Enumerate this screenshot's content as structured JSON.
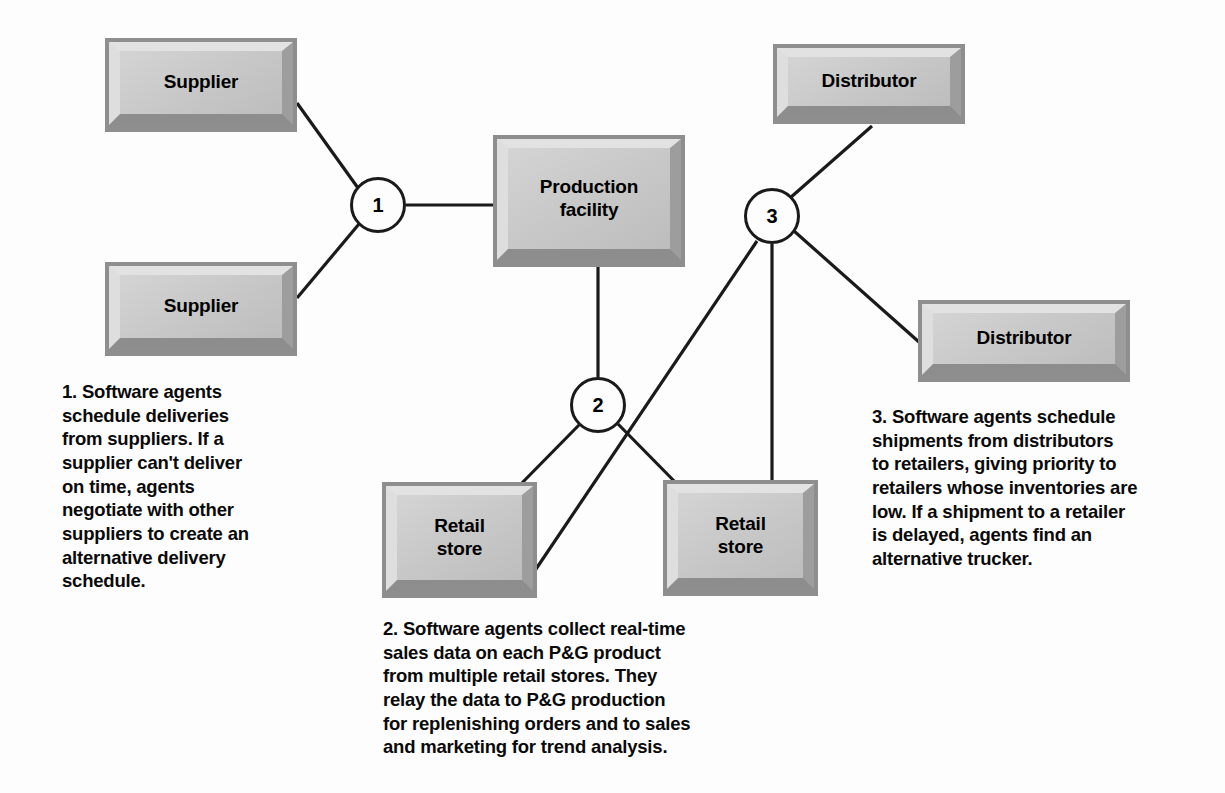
{
  "diagram": {
    "background_color": "#fdfdfd",
    "edge_color": "#1a1a1a",
    "box_fill_color": "#c9c9c9",
    "box_highlight_color": "#e2e2e2",
    "box_shadow_color": "#8e8e8e"
  },
  "nodes": [
    {
      "id": "supplier-top",
      "label": "Supplier",
      "x": 105,
      "y": 38,
      "w": 192,
      "h": 94
    },
    {
      "id": "supplier-bottom",
      "label": "Supplier",
      "x": 105,
      "y": 262,
      "w": 192,
      "h": 94
    },
    {
      "id": "production-facility",
      "label": "Production\nfacility",
      "x": 493,
      "y": 135,
      "w": 192,
      "h": 132
    },
    {
      "id": "distributor-top",
      "label": "Distributor",
      "x": 773,
      "y": 44,
      "w": 192,
      "h": 80
    },
    {
      "id": "distributor-bottom",
      "label": "Distributor",
      "x": 918,
      "y": 300,
      "w": 212,
      "h": 82
    },
    {
      "id": "retail-store-left",
      "label": "Retail\nstore",
      "x": 382,
      "y": 482,
      "w": 155,
      "h": 116
    },
    {
      "id": "retail-store-right",
      "label": "Retail\nstore",
      "x": 663,
      "y": 480,
      "w": 155,
      "h": 116
    }
  ],
  "circles": [
    {
      "id": "node-1",
      "number": "1",
      "cx": 378,
      "cy": 205,
      "r": 28
    },
    {
      "id": "node-2",
      "number": "2",
      "cx": 598,
      "cy": 405,
      "r": 28
    },
    {
      "id": "node-3",
      "number": "3",
      "cx": 772,
      "cy": 216,
      "r": 28
    }
  ],
  "edges": [
    {
      "id": "edge-supplier-top-to-1",
      "from": "supplier-top",
      "to": "node-1",
      "x1": 297,
      "y1": 103,
      "x2": 358,
      "y2": 188
    },
    {
      "id": "edge-supplier-bottom-to-1",
      "from": "supplier-bottom",
      "to": "node-1",
      "x1": 297,
      "y1": 298,
      "x2": 359,
      "y2": 224
    },
    {
      "id": "edge-1-to-production",
      "from": "node-1",
      "to": "production-facility",
      "x1": 406,
      "y1": 205,
      "x2": 493,
      "y2": 205
    },
    {
      "id": "edge-production-to-2",
      "from": "production-facility",
      "to": "node-2",
      "x1": 598,
      "y1": 267,
      "x2": 598,
      "y2": 377
    },
    {
      "id": "edge-2-to-retail-left",
      "from": "node-2",
      "to": "retail-store-left",
      "x1": 579,
      "y1": 425,
      "x2": 518,
      "y2": 487
    },
    {
      "id": "edge-2-to-retail-right",
      "from": "node-2",
      "to": "retail-store-right",
      "x1": 618,
      "y1": 424,
      "x2": 680,
      "y2": 487
    },
    {
      "id": "edge-3-to-retail-left",
      "from": "node-3",
      "to": "retail-store-left",
      "x1": 757,
      "y1": 241,
      "x2": 534,
      "y2": 572
    },
    {
      "id": "edge-3-to-retail-right",
      "from": "node-3",
      "to": "retail-store-right",
      "x1": 772,
      "y1": 244,
      "x2": 772,
      "y2": 485
    },
    {
      "id": "edge-3-to-distributor-top",
      "from": "node-3",
      "to": "distributor-top",
      "x1": 790,
      "y1": 198,
      "x2": 872,
      "y2": 126
    },
    {
      "id": "edge-3-to-distributor-bottom",
      "from": "node-3",
      "to": "distributor-bottom",
      "x1": 794,
      "y1": 231,
      "x2": 928,
      "y2": 350
    }
  ],
  "captions": [
    {
      "id": "caption-1",
      "number": "1",
      "x": 62,
      "y": 380,
      "w": 250,
      "text": "1. Software agents\nschedule deliveries\nfrom suppliers. If a\nsupplier can't deliver\non time, agents\nnegotiate with other\nsuppliers to create an\nalternative delivery\nschedule."
    },
    {
      "id": "caption-2",
      "number": "2",
      "x": 383,
      "y": 617,
      "w": 420,
      "text": "2. Software agents collect real-time\nsales data on each P&G product\nfrom multiple retail stores. They\nrelay the data to P&G production\nfor replenishing orders and to sales\nand marketing for trend analysis."
    },
    {
      "id": "caption-3",
      "number": "3",
      "x": 872,
      "y": 405,
      "w": 290,
      "text": "3. Software agents schedule\nshipments from distributors\nto retailers, giving priority to\nretailers whose inventories are\nlow. If a shipment to a retailer\nis delayed, agents find an\nalternative trucker."
    }
  ]
}
